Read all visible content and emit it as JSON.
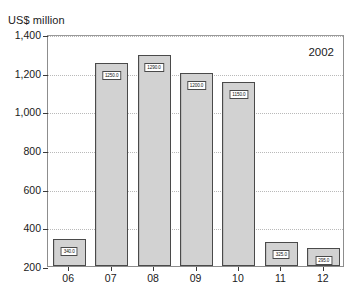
{
  "chart_data": {
    "type": "bar",
    "title": "US$ million",
    "xlabel": "",
    "ylabel": "US$ million",
    "categories": [
      "06",
      "07",
      "08",
      "09",
      "10",
      "11",
      "12"
    ],
    "values": [
      340.0,
      1250.0,
      1290.0,
      1200.0,
      1150.0,
      325.0,
      295.0
    ],
    "value_labels": [
      "340.0",
      "1250.0",
      "1290.0",
      "1200.0",
      "1150.0",
      "325.0",
      "295.0"
    ],
    "ylim": [
      200,
      1400
    ],
    "yticks": [
      200,
      400,
      600,
      800,
      1000,
      1200,
      1400
    ],
    "ytick_labels": [
      "200",
      "400",
      "600",
      "800",
      "1,000",
      "1,200",
      "1,400"
    ],
    "grid": true,
    "legend": false,
    "annotations": [
      {
        "text": "2002",
        "position": "top-right"
      }
    ],
    "colors": {
      "bar_fill": "#d2d2d2",
      "bar_border": "#4a4a4a",
      "gridline": "#b9b9b9",
      "axis": "#8d8d8d",
      "text": "#1a1a1a",
      "label_background": "#ffffff"
    }
  },
  "annotation_year": "2002"
}
